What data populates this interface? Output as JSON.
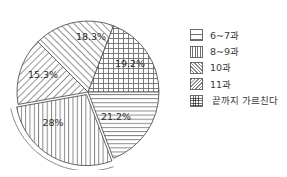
{
  "chart_data": {
    "type": "pie",
    "title": "",
    "subtitle": "",
    "xlabel": "",
    "ylabel": "",
    "grid": false,
    "legend_position": "right",
    "start_angle_deg": 0,
    "direction": "counterclockwise",
    "categories": [
      "6~7과",
      "8~9과",
      "10과",
      "11과",
      "끝까지 가르친다"
    ],
    "values": [
      21.2,
      28,
      15.3,
      18.3,
      19.2
    ],
    "labels": [
      "21.2%",
      "28%",
      "15.3%",
      "18.3%",
      "19.2%"
    ],
    "patterns": [
      "horizontal-lines",
      "vertical-lines",
      "diagonal-forward-hatch",
      "diagonal-back-hatch",
      "cross-hatch"
    ],
    "slices": [
      {
        "name": "끝까지 가르친다",
        "value": 19.2,
        "label": "19.2%",
        "pattern": "cross-hatch",
        "start_deg": 0,
        "end_deg": 69.1,
        "label_x": 122,
        "label_y": 59
      },
      {
        "name": "11과",
        "value": 18.3,
        "label": "18.3%",
        "pattern": "diagonal-back-hatch",
        "start_deg": 69.1,
        "end_deg": 135.0,
        "label_x": 83,
        "label_y": 32
      },
      {
        "name": "10과",
        "value": 15.3,
        "label": "15.3%",
        "pattern": "diagonal-forward-hatch",
        "start_deg": 135.0,
        "end_deg": 190.1,
        "label_x": 35,
        "label_y": 70
      },
      {
        "name": "8~9과",
        "value": 28,
        "label": "28%",
        "pattern": "vertical-lines",
        "start_deg": 190.1,
        "end_deg": 290.9,
        "label_x": 45,
        "label_y": 118
      },
      {
        "name": "6~7과",
        "value": 21.2,
        "label": "21.2%",
        "pattern": "horizontal-lines",
        "start_deg": 290.9,
        "end_deg": 360.0,
        "label_x": 108,
        "label_y": 112
      }
    ],
    "colors": {
      "stroke": "#555555",
      "fill": "#ffffff",
      "text": "#2b2b2b",
      "hatch": "#777777"
    }
  },
  "legend": {
    "items": [
      {
        "label": "6~7과",
        "pattern": "horizontal-lines"
      },
      {
        "label": "8~9과",
        "pattern": "vertical-lines"
      },
      {
        "label": "10과",
        "pattern": "diagonal-forward-hatch"
      },
      {
        "label": "11과",
        "pattern": "diagonal-back-hatch"
      },
      {
        "label": "끝까지 가르친다",
        "pattern": "cross-hatch"
      }
    ]
  }
}
